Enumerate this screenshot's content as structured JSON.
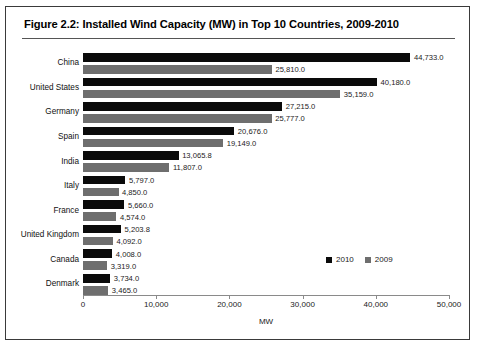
{
  "figure": {
    "title": "Figure 2.2: Installed Wind Capacity (MW) in Top 10 Countries, 2009-2010"
  },
  "legend": {
    "position": "inside-bottom-right",
    "items": [
      {
        "label": "2010",
        "color": "#0a0a0a"
      },
      {
        "label": "2009",
        "color": "#6e6e6e"
      }
    ]
  },
  "axis": {
    "x_title": "MW",
    "ticks": [
      "0",
      "10,000",
      "20,000",
      "30,000",
      "40,000",
      "50,000"
    ]
  },
  "chart_data": {
    "type": "bar",
    "orientation": "horizontal",
    "title": "Figure 2.2: Installed Wind Capacity (MW) in Top 10 Countries, 2009-2010",
    "xlabel": "MW",
    "ylabel": "",
    "xlim": [
      0,
      50000
    ],
    "xticks": [
      0,
      10000,
      20000,
      30000,
      40000,
      50000
    ],
    "xticklabels": [
      "0",
      "10,000",
      "20,000",
      "30,000",
      "40,000",
      "50,000"
    ],
    "grid": false,
    "legend_position": "inside-bottom-right",
    "categories": [
      "China",
      "United States",
      "Germany",
      "Spain",
      "India",
      "Italy",
      "France",
      "United Kingdom",
      "Canada",
      "Denmark"
    ],
    "series": [
      {
        "name": "2010",
        "color": "#0a0a0a",
        "values": [
          44733.0,
          40180.0,
          27215.0,
          20676.0,
          13065.8,
          5797.0,
          5660.0,
          5203.8,
          4008.0,
          3734.0
        ],
        "labels": [
          "44,733.0",
          "40,180.0",
          "27,215.0",
          "20,676.0",
          "13,065.8",
          "5,797.0",
          "5,660.0",
          "5,203.8",
          "4,008.0",
          "3,734.0"
        ]
      },
      {
        "name": "2009",
        "color": "#6e6e6e",
        "values": [
          25810.0,
          35159.0,
          25777.0,
          19149.0,
          11807.0,
          4850.0,
          4574.0,
          4092.0,
          3319.0,
          3465.0
        ],
        "labels": [
          "25,810.0",
          "35,159.0",
          "25,777.0",
          "19,149.0",
          "11,807.0",
          "4,850.0",
          "4,574.0",
          "4,092.0",
          "3,319.0",
          "3,465.0"
        ]
      }
    ]
  }
}
